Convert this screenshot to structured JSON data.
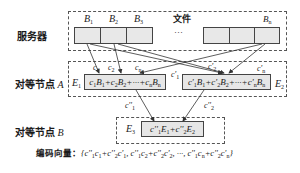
{
  "server": {
    "label": "服务器",
    "file_label": "文件",
    "ellipsis": "···",
    "blocks": [
      "B1",
      "B2",
      "B3",
      "Bn"
    ]
  },
  "peer_a": {
    "label": "对等节点 A",
    "e1_label": "E1",
    "e2_label": "E2",
    "e1_formula": "c1B1+c2B2+···+cnBn",
    "e2_formula": "c'1B1+c'2B2+···+c'nBn",
    "coefficients_e1": [
      "c1",
      "c2",
      "cn"
    ],
    "coefficients_e2": [
      "c'1",
      "c'2",
      "c'n"
    ]
  },
  "peer_b": {
    "label": "对等节点 B",
    "e3_label": "E3",
    "e3_formula": "c''1E1+c''2E2",
    "coefficients": [
      "c''1",
      "c''2"
    ]
  },
  "coding_vector": {
    "label": "编码向量：",
    "value": "{c''1c1+c''2c'1, c''1c2+c''2c'2, ···, c''1cn+c''2c'n}"
  },
  "colors": {
    "cell_fill": "#e8e8e8",
    "stroke": "#444444"
  }
}
